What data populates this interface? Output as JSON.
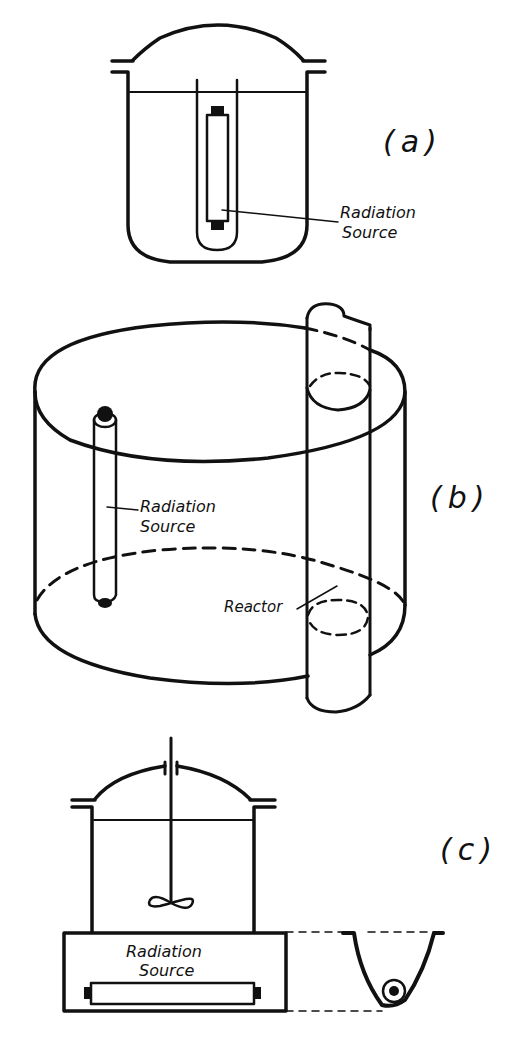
{
  "figure": {
    "panels": [
      {
        "id": "a",
        "label": "(a)",
        "annotations": [
          "Radiation",
          "Source"
        ]
      },
      {
        "id": "b",
        "label": "(b)",
        "annotations": [
          "Radiation",
          "Source",
          "Reactor"
        ]
      },
      {
        "id": "c",
        "label": "(c)",
        "annotations": [
          "Radiation",
          "Source"
        ]
      }
    ]
  },
  "colors": {
    "ink": "#111111",
    "background": "#ffffff"
  }
}
